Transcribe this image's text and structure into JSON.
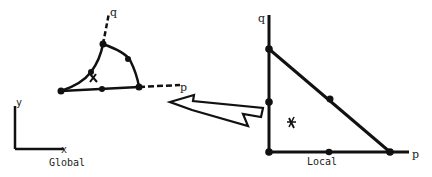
{
  "diagram": {
    "global_label": "Global",
    "local_label": "Local",
    "global_axes": {
      "x": "x",
      "y": "y"
    },
    "global_element": {
      "p_axis": "p",
      "q_axis": "q",
      "centroid_marker": "x"
    },
    "local_element": {
      "p_axis": "p",
      "q_axis": "q",
      "centroid_marker": "x"
    },
    "mapping_arrow": "arrow from local element to global element"
  },
  "colors": {
    "ink": "#111111",
    "background": "#ffffff"
  }
}
